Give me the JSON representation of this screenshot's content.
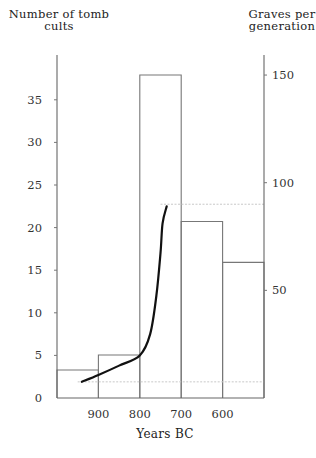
{
  "chart_data": {
    "type": "bar",
    "title": "",
    "xlabel": "Years BC",
    "ylabel_left": "Number of tomb cults",
    "ylabel_right": "Graves per generation",
    "x_ticks": [
      "900",
      "800",
      "700",
      "600"
    ],
    "y_left_ticks": [
      "0",
      "5",
      "10",
      "15",
      "20",
      "25",
      "30",
      "35"
    ],
    "y_right_ticks": [
      "50",
      "100",
      "150"
    ],
    "ylim_left": [
      0,
      40
    ],
    "ylim_right": [
      0,
      160
    ],
    "grid": false,
    "legend": null,
    "series": [
      {
        "name": "Graves per generation",
        "type": "bar",
        "axis": "right",
        "bins": [
          {
            "from": 1000,
            "to": 900,
            "value": 13
          },
          {
            "from": 900,
            "to": 800,
            "value": 20
          },
          {
            "from": 800,
            "to": 700,
            "value": 150
          },
          {
            "from": 700,
            "to": 600,
            "value": 82
          },
          {
            "from": 600,
            "to": 500,
            "value": 63
          }
        ]
      },
      {
        "name": "Number of tomb cults",
        "type": "line",
        "axis": "left",
        "points": [
          {
            "x": 940,
            "y": 1.9
          },
          {
            "x": 900,
            "y": 2.7
          },
          {
            "x": 850,
            "y": 3.8
          },
          {
            "x": 800,
            "y": 5.0
          },
          {
            "x": 775,
            "y": 7.5
          },
          {
            "x": 760,
            "y": 12.0
          },
          {
            "x": 750,
            "y": 17.0
          },
          {
            "x": 745,
            "y": 20.5
          },
          {
            "x": 735,
            "y": 22.5
          }
        ]
      },
      {
        "name": "Reference levels (dotted)",
        "type": "hline",
        "axis": "right",
        "values": [
          7.5,
          90
        ]
      }
    ]
  }
}
